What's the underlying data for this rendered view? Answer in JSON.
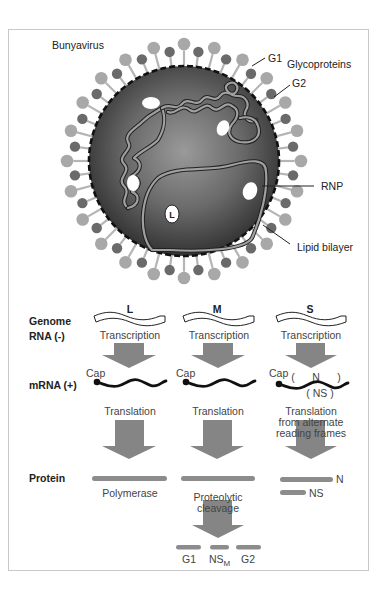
{
  "virion": {
    "title": "Bunyavirus",
    "labels": {
      "g1": "G1",
      "glycoproteins": "Glycoproteins",
      "g2": "G2",
      "rnp": "RNP",
      "lipid_bilayer": "Lipid bilayer",
      "polymerase_marker": "L"
    }
  },
  "row_labels": {
    "genome_line1": "Genome",
    "genome_line2": "RNA (-)",
    "mrna": "mRNA (+)",
    "protein": "Protein"
  },
  "segments": [
    {
      "name": "L",
      "step1": "Transcription",
      "cap": "Cap",
      "step2": "Translation",
      "products": [
        "Polymerase"
      ]
    },
    {
      "name": "M",
      "step1": "Transcription",
      "cap": "Cap",
      "step2": "Translation",
      "cleavage_line1": "Proteolytic",
      "cleavage_line2": "cleavage",
      "products": [
        "G1",
        "NS",
        "G2"
      ],
      "ns_subscript": "M"
    },
    {
      "name": "S",
      "step1": "Transcription",
      "cap": "Cap",
      "orf_n": "(      N      )",
      "orf_ns": "( NS )",
      "step2_line1": "Translation",
      "step2_line2": "from alternate",
      "step2_line3": "reading frames",
      "products": [
        "N",
        "NS"
      ]
    }
  ],
  "colors": {
    "frame_border": "#c9c9c9",
    "virion_dark": "#3a3a3a",
    "virion_light": "#8a8a8a",
    "glyco_light": "#a8a8a8",
    "glyco_dark": "#6a6a6a",
    "arrow": "#858585",
    "protein_bar": "#8c8c8c",
    "rnp_strand": "#9a9a9a"
  }
}
